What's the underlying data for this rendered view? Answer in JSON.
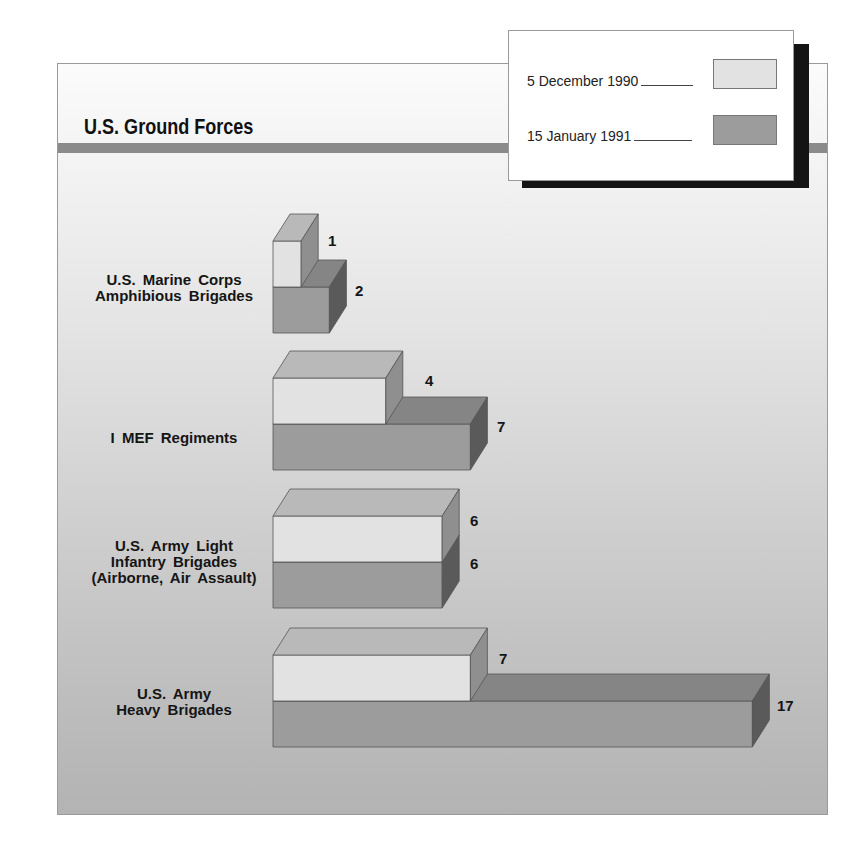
{
  "title": "U.S. Ground Forces",
  "legend": {
    "items": [
      {
        "label": "5 December 1990",
        "color": "#e2e2e2"
      },
      {
        "label": "15 January 1991",
        "color": "#9c9c9c"
      }
    ]
  },
  "colors": {
    "light_front": "#e2e2e2",
    "light_top": "#b9b9b9",
    "light_side": "#8f8f8f",
    "dark_front": "#9c9c9c",
    "dark_top": "#858585",
    "dark_side": "#5a5a5a",
    "rule": "#8a8a8a"
  },
  "categories": [
    {
      "label": "U.S. Marine Corps\nAmphibious Brigades",
      "dec_1990": 1,
      "jan_1991": 2
    },
    {
      "label": "I MEF Regiments",
      "dec_1990": 4,
      "jan_1991": 7
    },
    {
      "label": "U.S. Army Light\nInfantry Brigades\n(Airborne, Air Assault)",
      "dec_1990": 6,
      "jan_1991": 6
    },
    {
      "label": "U.S. Army\nHeavy Brigades",
      "dec_1990": 7,
      "jan_1991": 17
    }
  ],
  "chart_data": {
    "type": "bar",
    "orientation": "horizontal",
    "style": "3d",
    "title": "U.S. Ground Forces",
    "categories": [
      "U.S. Marine Corps Amphibious Brigades",
      "I MEF Regiments",
      "U.S. Army Light Infantry Brigades (Airborne, Air Assault)",
      "U.S. Army Heavy Brigades"
    ],
    "series": [
      {
        "name": "5 December 1990",
        "values": [
          1,
          4,
          6,
          7
        ]
      },
      {
        "name": "15 January 1991",
        "values": [
          2,
          7,
          6,
          17
        ]
      }
    ],
    "xlabel": "",
    "ylabel": "",
    "grid": false,
    "legend_position": "top-right",
    "data_labels": true
  }
}
